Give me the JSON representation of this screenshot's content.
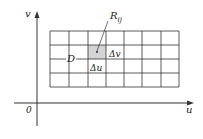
{
  "diagram": {
    "axes": {
      "x_label": "u",
      "y_label": "v",
      "origin_label": "0"
    },
    "region_label": "D",
    "cell_label": "R",
    "cell_label_subscript": "ij",
    "delta_u_label": "Δu",
    "delta_v_label": "Δv",
    "grid": {
      "columns": 7,
      "rows": 4
    },
    "colors": {
      "line": "#333333",
      "cell_fill": "#d4d4d4",
      "background": "#ffffff"
    }
  }
}
